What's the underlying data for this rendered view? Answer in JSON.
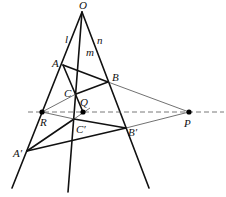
{
  "diagram": {
    "points": {
      "O": {
        "label": "O",
        "x": 82,
        "y": 12
      },
      "A": {
        "label": "A",
        "x": 63,
        "y": 65
      },
      "B": {
        "label": "B",
        "x": 108,
        "y": 82
      },
      "C": {
        "label": "C",
        "x": 76,
        "y": 94
      },
      "A2": {
        "label": "A′",
        "x": 27,
        "y": 151
      },
      "B2": {
        "label": "B′",
        "x": 126,
        "y": 128
      },
      "C2": {
        "label": "C′",
        "x": 74,
        "y": 119
      },
      "P": {
        "label": "P",
        "x": 189,
        "y": 112
      },
      "Q": {
        "label": "Q",
        "x": 83,
        "y": 112
      },
      "R": {
        "label": "R",
        "x": 42,
        "y": 112
      }
    },
    "lines": {
      "l": {
        "label": "l"
      },
      "m": {
        "label": "m"
      },
      "n": {
        "label": "n"
      }
    },
    "axis_line": "dashed line through R, Q, P"
  }
}
